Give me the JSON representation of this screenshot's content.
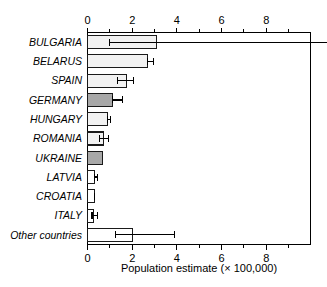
{
  "chart_data": {
    "type": "bar",
    "orientation": "horizontal",
    "title": "",
    "xlabel": "Population estimate (× 100,000)",
    "ylabel": "",
    "xlim": [
      0,
      10
    ],
    "xticks": [
      0,
      2,
      4,
      6,
      8
    ],
    "xtick_labels": [
      "0",
      "2",
      "4",
      "6",
      "8"
    ],
    "minor_xticks": [
      1,
      3,
      5,
      7,
      9
    ],
    "grid": false,
    "legend": null,
    "axis_top": true,
    "axis_bottom": true,
    "categories": [
      "BULGARIA",
      "BELARUS",
      "SPAIN",
      "GERMANY",
      "HUNGARY",
      "ROMANIA",
      "UKRAINE",
      "LATVIA",
      "CROATIA",
      "ITALY",
      "Other countries"
    ],
    "values": [
      3.1,
      2.7,
      1.75,
      1.1,
      0.88,
      0.72,
      0.67,
      0.33,
      0.3,
      0.27,
      2.0
    ],
    "err_low": [
      1.0,
      2.7,
      1.35,
      1.1,
      0.88,
      0.55,
      null,
      0.33,
      0.3,
      0.2,
      1.25
    ],
    "err_high": [
      10.0,
      2.95,
      2.05,
      1.55,
      1.02,
      0.95,
      null,
      0.45,
      0.33,
      0.45,
      3.9
    ],
    "bar_fills": [
      "#f2f2f2",
      "#f2f2f2",
      "#f2f2f2",
      "#a8a8a8",
      "#f2f2f2",
      "#f2f2f2",
      "#a8a8a8",
      "#ffffff",
      "#ffffff",
      "#ffffff",
      "#ffffff"
    ],
    "colors": {
      "bar_light": "#f2f2f2",
      "bar_dark": "#a8a8a8",
      "bar_white": "#ffffff",
      "outline": "#1a1a1a",
      "axis": "#000000",
      "text": "#000000",
      "background": "#ffffff"
    },
    "notes": {
      "bulgaria_error_clipped": "BULGARIA upper error bar extends beyond the right plot edge"
    }
  }
}
